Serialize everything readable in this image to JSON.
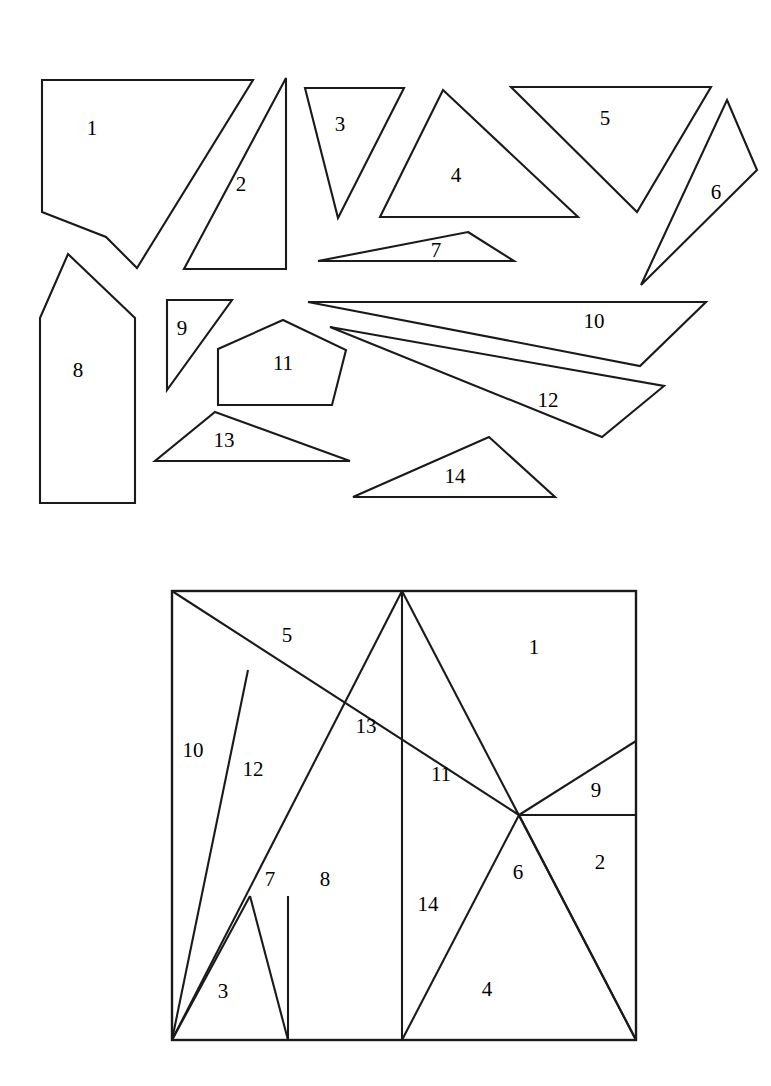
{
  "figure": {
    "stroke_color": "#1a1a1a",
    "fill_color": "#ffffff",
    "background": "#ffffff",
    "piece_count": 14
  },
  "scattered_pieces": [
    {
      "id": "1",
      "label": "1",
      "label_x": 92,
      "label_y": 130,
      "points": "42,80 253,80 137,268 106,237 42,212"
    },
    {
      "id": "2",
      "label": "2",
      "label_y": 186,
      "label_x": 241,
      "points": "286,78 286,269 184,269"
    },
    {
      "id": "3",
      "label": "3",
      "label_x": 340,
      "label_y": 126,
      "points": "305,88 404,88 338,218"
    },
    {
      "id": "4",
      "label": "4",
      "label_x": 456,
      "label_y": 177,
      "points": "443,90 578,217 380,217"
    },
    {
      "id": "5",
      "label": "5",
      "label_x": 605,
      "label_y": 120,
      "points": "511,87 711,87 637,212"
    },
    {
      "id": "6",
      "label": "6",
      "label_x": 716,
      "label_y": 194,
      "points": "727,100 757,170 641,285"
    },
    {
      "id": "7",
      "label": "7",
      "label_x": 436,
      "label_y": 252,
      "points": "468,232 514,261 318,261"
    },
    {
      "id": "8",
      "label": "8",
      "label_x": 78,
      "label_y": 372,
      "points": "68,254 135,318 135,503 40,503 40,318"
    },
    {
      "id": "9",
      "label": "9",
      "label_x": 182,
      "label_y": 330,
      "points": "167,300 232,300 167,390"
    },
    {
      "id": "10",
      "label": "10",
      "label_x": 594,
      "label_y": 323,
      "points": "308,302 706,302 640,366"
    },
    {
      "id": "11",
      "label": "11",
      "label_x": 283,
      "label_y": 365,
      "points": "283,320 346,350 332,405 218,405 218,349"
    },
    {
      "id": "12",
      "label": "12",
      "label_x": 548,
      "label_y": 402,
      "points": "330,327 664,386 602,437"
    },
    {
      "id": "13",
      "label": "13",
      "label_x": 224,
      "label_y": 442,
      "points": "215,412 350,461 155,461"
    },
    {
      "id": "14",
      "label": "14",
      "label_x": 455,
      "label_y": 478,
      "points": "489,437 555,497 353,497"
    }
  ],
  "assembled_square": {
    "bounds": {
      "x": 172,
      "y": 591,
      "width": 464,
      "height": 449
    },
    "cut_lines": [
      "172,591 519,815",
      "402,591 172,1040",
      "402,591 402,1040",
      "402,591 636,1040",
      "248,670 172,1040",
      "288,896 288,1040",
      "250,896 172,1040",
      "250,896 288,1040",
      "519,815 636,741",
      "519,815 636,815",
      "519,815 636,1040",
      "519,815 402,1040"
    ],
    "labels": [
      {
        "text": "5",
        "x": 287,
        "y": 637
      },
      {
        "text": "1",
        "x": 534,
        "y": 649
      },
      {
        "text": "13",
        "x": 366,
        "y": 728
      },
      {
        "text": "10",
        "x": 193,
        "y": 752
      },
      {
        "text": "12",
        "x": 253,
        "y": 771
      },
      {
        "text": "11",
        "x": 441,
        "y": 776
      },
      {
        "text": "9",
        "x": 596,
        "y": 792
      },
      {
        "text": "2",
        "x": 600,
        "y": 864
      },
      {
        "text": "7",
        "x": 270,
        "y": 881
      },
      {
        "text": "8",
        "x": 325,
        "y": 881
      },
      {
        "text": "6",
        "x": 518,
        "y": 874
      },
      {
        "text": "14",
        "x": 428,
        "y": 906
      },
      {
        "text": "3",
        "x": 223,
        "y": 993
      },
      {
        "text": "4",
        "x": 487,
        "y": 991
      }
    ]
  }
}
